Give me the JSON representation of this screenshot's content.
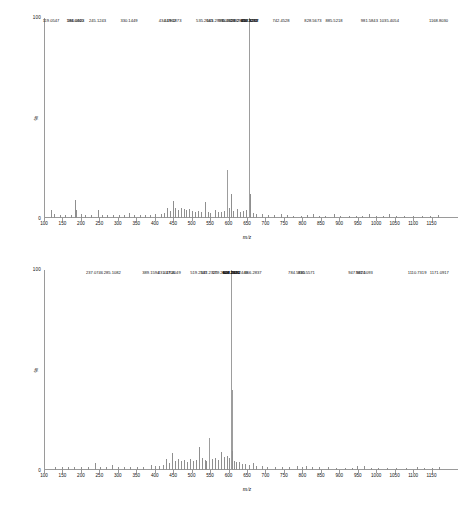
{
  "axis": {
    "y_top_label": "100",
    "y_bottom_label": "0",
    "y_axis_title": "%",
    "x_axis_title": "m/z",
    "x_ticks": [
      100,
      150,
      200,
      250,
      300,
      350,
      400,
      450,
      500,
      550,
      600,
      650,
      700,
      750,
      800,
      850,
      900,
      950,
      1000,
      1050,
      1100,
      1150
    ]
  },
  "colors": {
    "axis": "#9a9a9a",
    "peak": "#8f8f8f",
    "text": "#111111",
    "background": "#ffffff"
  },
  "chart_data": [
    {
      "type": "bar",
      "name": "spectrum-top",
      "title": "",
      "xlabel": "m/z",
      "ylabel": "%",
      "xlim": [
        100,
        1200
      ],
      "ylim": [
        0,
        100
      ],
      "grid": false,
      "legend": "none",
      "labeled_peaks": [
        {
          "mz": 119.0547,
          "intensity": 4.0,
          "label": "119.0547"
        },
        {
          "mz": 184.044,
          "intensity": 9.0,
          "label": "184.0440"
        },
        {
          "mz": 186.0923,
          "intensity": 4.0,
          "label": "186.0923"
        },
        {
          "mz": 245.1243,
          "intensity": 4.0,
          "label": "245.1243"
        },
        {
          "mz": 330.1449,
          "intensity": 2.5,
          "label": "330.1449"
        },
        {
          "mz": 434.1962,
          "intensity": 5.0,
          "label": "434.1962"
        },
        {
          "mz": 449.1873,
          "intensity": 8.5,
          "label": "449.1873"
        },
        {
          "mz": 535.2645,
          "intensity": 8.0,
          "label": "535.2645"
        },
        {
          "mz": 563.2991,
          "intensity": 4.0,
          "label": "563.2991"
        },
        {
          "mz": 595.2956,
          "intensity": 24.0,
          "label": "595.2956"
        },
        {
          "mz": 606.2992,
          "intensity": 12.0,
          "label": "606.2992"
        },
        {
          "mz": 623.2929,
          "intensity": 4.5,
          "label": "623.2929"
        },
        {
          "mz": 655.3232,
          "intensity": 100.0,
          "label": "655.3232"
        },
        {
          "mz": 656.3271,
          "intensity": 42.0,
          "label": "656.3271"
        },
        {
          "mz": 657.3288,
          "intensity": 12.0,
          "label": "657.3288"
        },
        {
          "mz": 658.3317,
          "intensity": 4.0,
          "label": "658.3317"
        },
        {
          "mz": 742.4528,
          "intensity": 2.0,
          "label": "742.4528"
        },
        {
          "mz": 828.5673,
          "intensity": 2.0,
          "label": "828.5673"
        },
        {
          "mz": 885.5218,
          "intensity": 2.0,
          "label": "885.5218"
        },
        {
          "mz": 981.5843,
          "intensity": 2.0,
          "label": "981.5843"
        },
        {
          "mz": 1035.4054,
          "intensity": 2.0,
          "label": "1035.4054"
        },
        {
          "mz": 1168.803,
          "intensity": 1.5,
          "label": "1168.8030"
        }
      ],
      "unlabeled_peaks": [
        {
          "mz": 128.0,
          "intensity": 2.0
        },
        {
          "mz": 143.0,
          "intensity": 1.6
        },
        {
          "mz": 158.0,
          "intensity": 1.4
        },
        {
          "mz": 172.0,
          "intensity": 1.6
        },
        {
          "mz": 199.0,
          "intensity": 1.8
        },
        {
          "mz": 212.0,
          "intensity": 1.5
        },
        {
          "mz": 228.0,
          "intensity": 1.4
        },
        {
          "mz": 258.0,
          "intensity": 1.6
        },
        {
          "mz": 272.0,
          "intensity": 1.3
        },
        {
          "mz": 288.0,
          "intensity": 1.5
        },
        {
          "mz": 303.0,
          "intensity": 1.4
        },
        {
          "mz": 316.0,
          "intensity": 1.6
        },
        {
          "mz": 345.0,
          "intensity": 1.4
        },
        {
          "mz": 359.0,
          "intensity": 1.5
        },
        {
          "mz": 374.0,
          "intensity": 1.3
        },
        {
          "mz": 388.0,
          "intensity": 1.6
        },
        {
          "mz": 402.0,
          "intensity": 1.8
        },
        {
          "mz": 416.0,
          "intensity": 2.0
        },
        {
          "mz": 424.0,
          "intensity": 2.4
        },
        {
          "mz": 442.0,
          "intensity": 3.6
        },
        {
          "mz": 456.0,
          "intensity": 4.8
        },
        {
          "mz": 463.0,
          "intensity": 4.2
        },
        {
          "mz": 470.0,
          "intensity": 5.2
        },
        {
          "mz": 478.0,
          "intensity": 4.4
        },
        {
          "mz": 486.0,
          "intensity": 3.8
        },
        {
          "mz": 494.0,
          "intensity": 4.6
        },
        {
          "mz": 502.0,
          "intensity": 3.4
        },
        {
          "mz": 510.0,
          "intensity": 3.0
        },
        {
          "mz": 518.0,
          "intensity": 3.6
        },
        {
          "mz": 526.0,
          "intensity": 3.2
        },
        {
          "mz": 543.0,
          "intensity": 3.0
        },
        {
          "mz": 551.0,
          "intensity": 2.6
        },
        {
          "mz": 571.0,
          "intensity": 3.2
        },
        {
          "mz": 580.0,
          "intensity": 2.8
        },
        {
          "mz": 588.0,
          "intensity": 3.4
        },
        {
          "mz": 601.0,
          "intensity": 5.0
        },
        {
          "mz": 613.0,
          "intensity": 3.4
        },
        {
          "mz": 631.0,
          "intensity": 3.0
        },
        {
          "mz": 640.0,
          "intensity": 3.6
        },
        {
          "mz": 647.0,
          "intensity": 4.0
        },
        {
          "mz": 665.0,
          "intensity": 2.6
        },
        {
          "mz": 675.0,
          "intensity": 2.0
        },
        {
          "mz": 690.0,
          "intensity": 1.8
        },
        {
          "mz": 706.0,
          "intensity": 1.5
        },
        {
          "mz": 722.0,
          "intensity": 1.4
        },
        {
          "mz": 758.0,
          "intensity": 1.3
        },
        {
          "mz": 775.0,
          "intensity": 1.2
        },
        {
          "mz": 795.0,
          "intensity": 1.2
        },
        {
          "mz": 812.0,
          "intensity": 1.3
        },
        {
          "mz": 845.0,
          "intensity": 1.2
        },
        {
          "mz": 862.0,
          "intensity": 1.2
        },
        {
          "mz": 903.0,
          "intensity": 1.2
        },
        {
          "mz": 925.0,
          "intensity": 1.2
        },
        {
          "mz": 945.0,
          "intensity": 1.2
        },
        {
          "mz": 962.0,
          "intensity": 1.2
        },
        {
          "mz": 1000.0,
          "intensity": 1.2
        },
        {
          "mz": 1018.0,
          "intensity": 1.2
        },
        {
          "mz": 1055.0,
          "intensity": 1.2
        },
        {
          "mz": 1075.0,
          "intensity": 1.1
        },
        {
          "mz": 1100.0,
          "intensity": 1.1
        },
        {
          "mz": 1125.0,
          "intensity": 1.1
        },
        {
          "mz": 1145.0,
          "intensity": 1.1
        }
      ]
    },
    {
      "type": "bar",
      "name": "spectrum-bottom",
      "title": "",
      "xlabel": "m/z",
      "ylabel": "%",
      "xlim": [
        100,
        1200
      ],
      "ylim": [
        0,
        100
      ],
      "grid": false,
      "legend": "none",
      "labeled_peaks": [
        {
          "mz": 237.0746,
          "intensity": 3.5,
          "label": "237.0746"
        },
        {
          "mz": 285.1082,
          "intensity": 2.5,
          "label": "285.1082"
        },
        {
          "mz": 389.1594,
          "intensity": 2.5,
          "label": "389.1594"
        },
        {
          "mz": 431.1706,
          "intensity": 5.5,
          "label": "431.1706"
        },
        {
          "mz": 447.2049,
          "intensity": 8.5,
          "label": "447.2049"
        },
        {
          "mz": 519.2335,
          "intensity": 11.5,
          "label": "519.2335"
        },
        {
          "mz": 547.2325,
          "intensity": 16.0,
          "label": "547.2325"
        },
        {
          "mz": 579.262,
          "intensity": 9.0,
          "label": "579.2620"
        },
        {
          "mz": 606.252,
          "intensity": 20.0,
          "label": "606.2520"
        },
        {
          "mz": 607.2806,
          "intensity": 100.0,
          "label": "607.2806"
        },
        {
          "mz": 608.2632,
          "intensity": 40.0,
          "label": "608.2632"
        },
        {
          "mz": 608.2671,
          "intensity": 9.5,
          "label": "608.2671"
        },
        {
          "mz": 629.2449,
          "intensity": 4.0,
          "label": "629.2449"
        },
        {
          "mz": 666.2837,
          "intensity": 3.5,
          "label": "666.2837"
        },
        {
          "mz": 784.5385,
          "intensity": 2.0,
          "label": "784.5385"
        },
        {
          "mz": 810.5571,
          "intensity": 2.0,
          "label": "810.5571"
        },
        {
          "mz": 947.5824,
          "intensity": 2.0,
          "label": "947.5824"
        },
        {
          "mz": 967.5093,
          "intensity": 2.0,
          "label": "967.5093"
        },
        {
          "mz": 1110.7319,
          "intensity": 1.5,
          "label": "1110.7319"
        },
        {
          "mz": 1171.0917,
          "intensity": 1.5,
          "label": "1171.0917"
        }
      ],
      "unlabeled_peaks": [
        {
          "mz": 130.0,
          "intensity": 1.6
        },
        {
          "mz": 148.0,
          "intensity": 1.4
        },
        {
          "mz": 165.0,
          "intensity": 1.5
        },
        {
          "mz": 182.0,
          "intensity": 1.6
        },
        {
          "mz": 200.0,
          "intensity": 1.4
        },
        {
          "mz": 218.0,
          "intensity": 1.5
        },
        {
          "mz": 252.0,
          "intensity": 1.6
        },
        {
          "mz": 268.0,
          "intensity": 1.4
        },
        {
          "mz": 300.0,
          "intensity": 1.5
        },
        {
          "mz": 318.0,
          "intensity": 1.4
        },
        {
          "mz": 334.0,
          "intensity": 1.5
        },
        {
          "mz": 352.0,
          "intensity": 1.6
        },
        {
          "mz": 368.0,
          "intensity": 1.5
        },
        {
          "mz": 400.0,
          "intensity": 1.8
        },
        {
          "mz": 412.0,
          "intensity": 2.2
        },
        {
          "mz": 422.0,
          "intensity": 2.6
        },
        {
          "mz": 440.0,
          "intensity": 3.4
        },
        {
          "mz": 455.0,
          "intensity": 4.6
        },
        {
          "mz": 463.0,
          "intensity": 5.4
        },
        {
          "mz": 471.0,
          "intensity": 4.4
        },
        {
          "mz": 479.0,
          "intensity": 5.0
        },
        {
          "mz": 487.0,
          "intensity": 4.2
        },
        {
          "mz": 495.0,
          "intensity": 5.6
        },
        {
          "mz": 503.0,
          "intensity": 4.6
        },
        {
          "mz": 511.0,
          "intensity": 5.0
        },
        {
          "mz": 527.0,
          "intensity": 6.0
        },
        {
          "mz": 535.0,
          "intensity": 5.2
        },
        {
          "mz": 539.0,
          "intensity": 4.6
        },
        {
          "mz": 555.0,
          "intensity": 5.4
        },
        {
          "mz": 563.0,
          "intensity": 6.2
        },
        {
          "mz": 571.0,
          "intensity": 5.0
        },
        {
          "mz": 587.0,
          "intensity": 6.4
        },
        {
          "mz": 595.0,
          "intensity": 7.0
        },
        {
          "mz": 600.0,
          "intensity": 6.0
        },
        {
          "mz": 614.0,
          "intensity": 4.6
        },
        {
          "mz": 621.0,
          "intensity": 3.8
        },
        {
          "mz": 637.0,
          "intensity": 3.2
        },
        {
          "mz": 645.0,
          "intensity": 2.8
        },
        {
          "mz": 655.0,
          "intensity": 2.6
        },
        {
          "mz": 675.0,
          "intensity": 2.2
        },
        {
          "mz": 690.0,
          "intensity": 1.8
        },
        {
          "mz": 705.0,
          "intensity": 1.6
        },
        {
          "mz": 725.0,
          "intensity": 1.5
        },
        {
          "mz": 745.0,
          "intensity": 1.4
        },
        {
          "mz": 765.0,
          "intensity": 1.4
        },
        {
          "mz": 800.0,
          "intensity": 1.4
        },
        {
          "mz": 825.0,
          "intensity": 1.3
        },
        {
          "mz": 845.0,
          "intensity": 1.3
        },
        {
          "mz": 870.0,
          "intensity": 1.3
        },
        {
          "mz": 890.0,
          "intensity": 1.2
        },
        {
          "mz": 915.0,
          "intensity": 1.2
        },
        {
          "mz": 935.0,
          "intensity": 1.2
        },
        {
          "mz": 985.0,
          "intensity": 1.2
        },
        {
          "mz": 1005.0,
          "intensity": 1.2
        },
        {
          "mz": 1030.0,
          "intensity": 1.2
        },
        {
          "mz": 1055.0,
          "intensity": 1.1
        },
        {
          "mz": 1080.0,
          "intensity": 1.1
        },
        {
          "mz": 1130.0,
          "intensity": 1.1
        },
        {
          "mz": 1150.0,
          "intensity": 1.1
        }
      ]
    }
  ]
}
